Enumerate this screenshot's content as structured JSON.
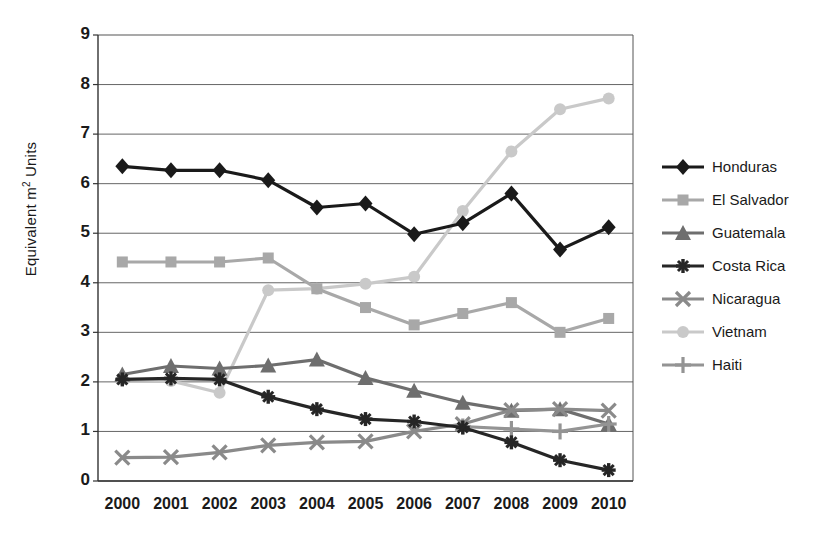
{
  "chart_data": {
    "type": "line",
    "title": "",
    "xlabel": "",
    "ylabel": "Equivalent m² Units",
    "ylabel_prefix": "Equivalent m",
    "ylabel_sup": "2",
    "ylabel_suffix": " Units",
    "categories": [
      "2000",
      "2001",
      "2002",
      "2003",
      "2004",
      "2005",
      "2006",
      "2007",
      "2008",
      "2009",
      "2010"
    ],
    "x": [
      2000,
      2001,
      2002,
      2003,
      2004,
      2005,
      2006,
      2007,
      2008,
      2009,
      2010
    ],
    "yticks": [
      0,
      1,
      2,
      3,
      4,
      5,
      6,
      7,
      8,
      9
    ],
    "ylim": [
      0,
      9
    ],
    "grid": true,
    "legend_position": "right",
    "series": [
      {
        "name": "Honduras",
        "color": "#1a1a1a",
        "marker": "diamond",
        "values": [
          6.35,
          6.27,
          6.27,
          6.07,
          5.52,
          5.6,
          4.98,
          5.2,
          5.8,
          4.67,
          5.12
        ]
      },
      {
        "name": "El Salvador",
        "color": "#a8a8a8",
        "marker": "square",
        "values": [
          4.42,
          4.42,
          4.42,
          4.5,
          3.88,
          3.5,
          3.15,
          3.38,
          3.6,
          3.0,
          3.28
        ]
      },
      {
        "name": "Guatemala",
        "color": "#6e6e6e",
        "marker": "triangle",
        "values": [
          2.15,
          2.32,
          2.27,
          2.33,
          2.45,
          2.08,
          1.82,
          1.58,
          1.42,
          1.45,
          1.15
        ]
      },
      {
        "name": "Costa Rica",
        "color": "#262626",
        "marker": "asterisk",
        "values": [
          2.05,
          2.07,
          2.05,
          1.7,
          1.45,
          1.25,
          1.2,
          1.08,
          0.78,
          0.42,
          0.22
        ]
      },
      {
        "name": "Nicaragua",
        "color": "#8a8a8a",
        "marker": "x",
        "values": [
          0.47,
          0.48,
          0.58,
          0.72,
          0.78,
          0.8,
          1.0,
          1.15,
          1.43,
          1.45,
          1.42
        ]
      },
      {
        "name": "Vietnam",
        "color": "#c9c9c9",
        "marker": "circle",
        "values": [
          2.05,
          2.02,
          1.78,
          3.85,
          3.88,
          3.98,
          4.12,
          5.45,
          6.65,
          7.5,
          7.72
        ]
      },
      {
        "name": "Haiti",
        "color": "#949494",
        "marker": "plus",
        "values": [
          null,
          null,
          null,
          null,
          null,
          null,
          null,
          1.1,
          1.05,
          1.0,
          1.15
        ]
      }
    ]
  },
  "legend": {
    "items": [
      {
        "label": "Honduras"
      },
      {
        "label": "El Salvador"
      },
      {
        "label": "Guatemala"
      },
      {
        "label": "Costa Rica"
      },
      {
        "label": "Nicaragua"
      },
      {
        "label": "Vietnam"
      },
      {
        "label": "Haiti"
      }
    ]
  }
}
